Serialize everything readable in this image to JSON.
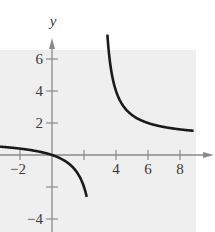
{
  "chart_data": {
    "type": "line",
    "title": "",
    "xlabel": "",
    "ylabel": "y",
    "function": "f(x) = x/(x-3)",
    "vertical_asymptote": 3,
    "horizontal_asymptote": 1,
    "xlim": [
      -3.2,
      9.5
    ],
    "ylim": [
      -4.8,
      7.2
    ],
    "x_ticks": [
      -2,
      2,
      4,
      6,
      8
    ],
    "x_tick_labels": [
      "-2",
      "4",
      "6",
      "8"
    ],
    "x_labeled_ticks": [
      -2,
      4,
      6,
      8
    ],
    "y_ticks": [
      -4,
      -2,
      2,
      4,
      6
    ],
    "y_tick_labels": [
      "6",
      "4",
      "2",
      "-4"
    ],
    "y_labeled_ticks": [
      6,
      4,
      2,
      -4
    ],
    "grid": false,
    "series": [
      {
        "name": "left branch",
        "x": [
          -3.2,
          -2,
          -1,
          0,
          1,
          1.5,
          2,
          2.2
        ],
        "y": [
          0.52,
          0.4,
          0.25,
          0,
          -0.5,
          -1,
          -2,
          -2.75
        ]
      },
      {
        "name": "right branch",
        "x": [
          3.4,
          4,
          5,
          6,
          7,
          8,
          9
        ],
        "y": [
          8.5,
          4,
          2.5,
          2,
          1.75,
          1.6,
          1.5
        ]
      }
    ],
    "colors": {
      "background": "#efefef",
      "axis": "#8a8a8a",
      "curve": "#1a1a1a",
      "text": "#3a3a3a"
    }
  }
}
